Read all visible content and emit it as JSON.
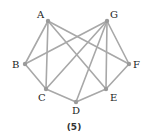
{
  "figure": {
    "caption": "(5)",
    "nodes": [
      {
        "id": "A",
        "x": 48,
        "y": 21,
        "lx": 37,
        "ly": 18
      },
      {
        "id": "G",
        "x": 107,
        "y": 21,
        "lx": 110,
        "ly": 18
      },
      {
        "id": "B",
        "x": 25,
        "y": 64,
        "lx": 12,
        "ly": 68
      },
      {
        "id": "F",
        "x": 129,
        "y": 64,
        "lx": 133,
        "ly": 68
      },
      {
        "id": "C",
        "x": 46,
        "y": 89,
        "lx": 38,
        "ly": 101
      },
      {
        "id": "E",
        "x": 106,
        "y": 89,
        "lx": 110,
        "ly": 101
      },
      {
        "id": "D",
        "x": 76,
        "y": 102,
        "lx": 72,
        "ly": 114
      }
    ],
    "edges": [
      [
        "A",
        "B"
      ],
      [
        "A",
        "C"
      ],
      [
        "A",
        "E"
      ],
      [
        "A",
        "F"
      ],
      [
        "G",
        "B"
      ],
      [
        "G",
        "C"
      ],
      [
        "G",
        "D"
      ],
      [
        "G",
        "E"
      ],
      [
        "G",
        "F"
      ],
      [
        "B",
        "C"
      ],
      [
        "C",
        "D"
      ],
      [
        "D",
        "E"
      ],
      [
        "E",
        "F"
      ]
    ],
    "colors": {
      "edge": "#a8a8a8",
      "node": "#9a9a9a",
      "label": "#222222"
    }
  }
}
